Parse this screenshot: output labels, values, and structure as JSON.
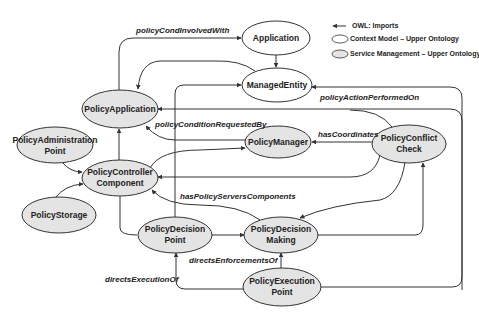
{
  "legend": {
    "imports_label": "OWL: Imports",
    "context_model_label": "Context Model – Upper Ontology",
    "service_management_label": "Service Management – Upper Ontology",
    "context_model_color": "#ffffff",
    "service_management_color": "#e4e4e4"
  },
  "nodes": {
    "application": {
      "line1": "Application",
      "type": "context-model"
    },
    "managed_entity": {
      "line1": "ManagedEntity",
      "type": "context-model"
    },
    "policy_application": {
      "line1": "PolicyApplication",
      "type": "service-management"
    },
    "policy_administration_point": {
      "line1": "PolicyAdministration",
      "line2": "Point",
      "type": "service-management"
    },
    "policy_manager": {
      "line1": "PolicyManager",
      "type": "service-management"
    },
    "policy_conflict_check": {
      "line1": "PolicyConflict",
      "line2": "Check",
      "type": "service-management"
    },
    "policy_controller_component": {
      "line1": "PolicyController",
      "line2": "Component",
      "type": "service-management"
    },
    "policy_storage": {
      "line1": "PolicyStorage",
      "type": "service-management"
    },
    "policy_decision_point": {
      "line1": "PolicyDecision",
      "line2": "Point",
      "type": "service-management"
    },
    "policy_decision_making": {
      "line1": "PolicyDecision",
      "line2": "Making",
      "type": "service-management"
    },
    "policy_execution_point": {
      "line1": "PolicyExecution",
      "line2": "Point",
      "type": "service-management"
    }
  },
  "edge_labels": {
    "policy_cond_involved_with": "policyCondInvolvedWith",
    "policy_action_performed_on": "policyActionPerformedOn",
    "policy_condition_requested_by": "policyConditionRequestedBy",
    "has_coordinates": "hasCoordinates",
    "has_policy_servers_components": "hasPolicyServersComponents",
    "directs_enforcements_of": "directsEnforcementsOf",
    "directs_execution_of": "directsExecutionOf"
  }
}
